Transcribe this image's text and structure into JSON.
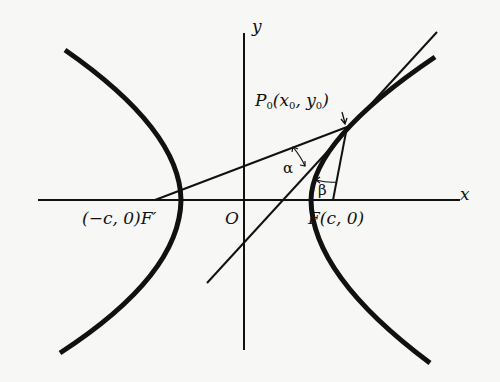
{
  "diagram": {
    "axes": {
      "x_label": "x",
      "y_label": "y",
      "origin_label": "O"
    },
    "points": {
      "left_focus": "(−c, 0)F′",
      "right_focus": "F(c, 0)",
      "point_on_curve_base": "P",
      "point_on_curve_sub": "0",
      "point_on_curve_coords_open": "(x",
      "point_on_curve_coords_sub1": "0",
      "point_on_curve_coords_mid": ", y",
      "point_on_curve_coords_sub2": "0",
      "point_on_curve_coords_close": ")"
    },
    "angles": {
      "alpha": "α",
      "beta": "β"
    },
    "colors": {
      "ink": "#111111",
      "paper": "#f7f7f5"
    }
  }
}
